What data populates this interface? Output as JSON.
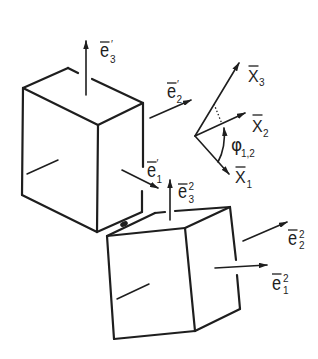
{
  "colors": {
    "ink": "#1e1e1e",
    "background": "#ffffff"
  },
  "labels": {
    "body1": {
      "e1": {
        "base": "e",
        "sup": "′",
        "sub": "1"
      },
      "e2": {
        "base": "e",
        "sup": "′",
        "sub": "2"
      },
      "e3": {
        "base": "e",
        "sup": "′",
        "sub": "3"
      }
    },
    "body2": {
      "e1": {
        "base": "e",
        "sup": "2",
        "sub": "1"
      },
      "e2": {
        "base": "e",
        "sup": "2",
        "sub": "2"
      },
      "e3": {
        "base": "e",
        "sup": "2",
        "sub": "3"
      }
    },
    "frame": {
      "x1": {
        "base": "X",
        "sub": "1"
      },
      "x2": {
        "base": "X",
        "sub": "2"
      },
      "x3": {
        "base": "X",
        "sub": "3"
      }
    },
    "angle": {
      "base": "φ",
      "sub": "1,2"
    }
  }
}
